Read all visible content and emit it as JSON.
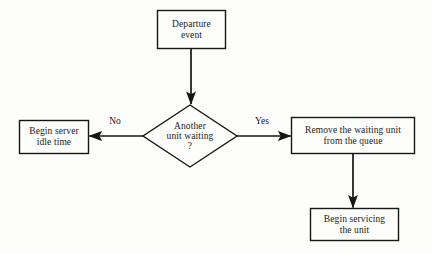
{
  "diagram": {
    "background_color": "#fdfdfc",
    "stroke_color": "#161616",
    "text_color": "#1a1a1a",
    "nodes": {
      "departure_event": {
        "label": "Departure\nevent",
        "shape": "rectangle"
      },
      "decision": {
        "label": "Another\nunit waiting\n?",
        "shape": "diamond"
      },
      "begin_idle": {
        "label": "Begin server\nidle time",
        "shape": "rectangle"
      },
      "remove_unit": {
        "label": "Remove the waiting unit\nfrom the queue",
        "shape": "rectangle"
      },
      "begin_servicing": {
        "label": "Begin servicing\nthe unit",
        "shape": "rectangle"
      }
    },
    "edges": {
      "no_label": "No",
      "yes_label": "Yes"
    }
  }
}
